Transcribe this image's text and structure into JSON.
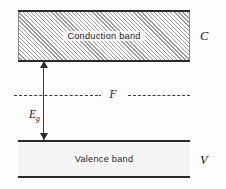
{
  "figure": {
    "type": "semiconductor-band-diagram",
    "conduction_band": {
      "label": "Conduction band",
      "side_label": "C",
      "fill": "hatched",
      "hatch_direction": "45deg",
      "border_color": "#2a2a2a"
    },
    "valence_band": {
      "label": "Valence band",
      "side_label": "V",
      "fill": "plain",
      "border_color": "#2a2a2a"
    },
    "fermi_level": {
      "label": "F",
      "line_style": "dash-dot",
      "color": "#3a3a3a"
    },
    "band_gap": {
      "symbol": "E",
      "subscript": "g",
      "arrow": "double-headed-vertical",
      "color": "#2a2a2a"
    }
  }
}
